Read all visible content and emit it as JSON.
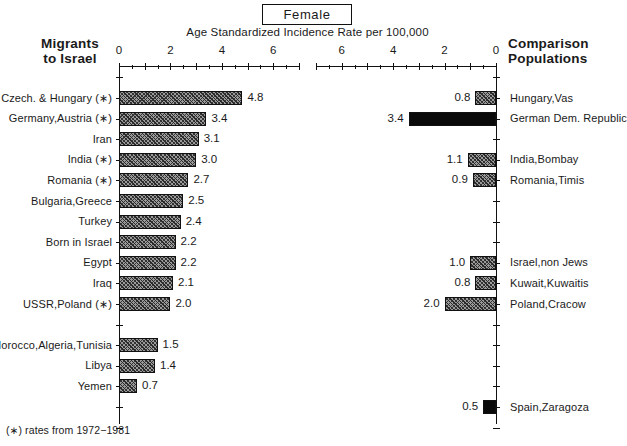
{
  "header": {
    "title": "Female",
    "subtitle": "Age Standardized Incidence Rate per 100,000"
  },
  "left_panel": {
    "heading_line1": "Migrants",
    "heading_line2": "to Israel"
  },
  "right_panel": {
    "heading_line1": "Comparison",
    "heading_line2": "Populations"
  },
  "footnote": "(∗) rates from 1972−1981",
  "axis": {
    "tick_labels": [
      "0",
      "2",
      "4",
      "6"
    ],
    "minor_step": 1,
    "max": 7,
    "left_ticks": [
      "0",
      "2",
      "4",
      "6"
    ],
    "right_ticks": [
      "6",
      "4",
      "2",
      "0"
    ]
  },
  "chart_data": {
    "type": "bar",
    "title": "Female",
    "subtitle": "Age Standardized Incidence Rate per 100,000",
    "xlabel": "Age Standardized Incidence Rate per 100,000",
    "ylabel": "",
    "xlim": [
      0,
      7
    ],
    "grid": false,
    "orientation": "horizontal",
    "legend": "none",
    "footnote": "(∗) rates from 1972−1981",
    "panels": [
      {
        "name": "Migrants to Israel",
        "direction": "left-to-right",
        "categories": [
          "Czech. & Hungary (∗)",
          "Germany,Austria (∗)",
          "Iran",
          "India (∗)",
          "Romania (∗)",
          "Bulgaria,Greece",
          "Turkey",
          "Born in Israel",
          "Egypt",
          "Iraq",
          "USSR,Poland (∗)",
          "Morocco,Algeria,Tunisia",
          "Libya",
          "Yemen"
        ],
        "values": [
          4.8,
          3.4,
          3.1,
          3.0,
          2.7,
          2.5,
          2.4,
          2.2,
          2.2,
          2.1,
          2.0,
          1.5,
          1.4,
          0.7
        ],
        "fills": [
          "hatch",
          "hatch",
          "hatch",
          "hatch",
          "hatch",
          "hatch",
          "hatch",
          "hatch",
          "hatch",
          "hatch",
          "hatch",
          "hatch",
          "hatch",
          "hatch"
        ]
      },
      {
        "name": "Comparison Populations",
        "direction": "right-to-left",
        "categories": [
          "Hungary,Vas",
          "German Dem. Republic",
          "India,Bombay",
          "Romania,Timis",
          "Israel,non Jews",
          "Kuwait,Kuwaitis",
          "Poland,Cracow",
          "Spain,Zaragoza"
        ],
        "values": [
          0.8,
          3.4,
          1.1,
          0.9,
          1.0,
          0.8,
          2.0,
          0.5
        ],
        "fills": [
          "hatch",
          "solid",
          "hatch",
          "hatch",
          "hatch",
          "hatch",
          "hatch",
          "solid"
        ]
      }
    ]
  },
  "rows": {
    "left": [
      {
        "label": "Czech. & Hungary (∗)",
        "value": 4.8,
        "value_text": "4.8",
        "fill": "hatch",
        "slot": 0
      },
      {
        "label": "Germany,Austria (∗)",
        "value": 3.4,
        "value_text": "3.4",
        "fill": "hatch",
        "slot": 1
      },
      {
        "label": "Iran",
        "value": 3.1,
        "value_text": "3.1",
        "fill": "hatch",
        "slot": 2
      },
      {
        "label": "India (∗)",
        "value": 3.0,
        "value_text": "3.0",
        "fill": "hatch",
        "slot": 3
      },
      {
        "label": "Romania (∗)",
        "value": 2.7,
        "value_text": "2.7",
        "fill": "hatch",
        "slot": 4
      },
      {
        "label": "Bulgaria,Greece",
        "value": 2.5,
        "value_text": "2.5",
        "fill": "hatch",
        "slot": 5
      },
      {
        "label": "Turkey",
        "value": 2.4,
        "value_text": "2.4",
        "fill": "hatch",
        "slot": 6
      },
      {
        "label": "Born in Israel",
        "value": 2.2,
        "value_text": "2.2",
        "fill": "hatch",
        "slot": 7
      },
      {
        "label": "Egypt",
        "value": 2.2,
        "value_text": "2.2",
        "fill": "hatch",
        "slot": 8
      },
      {
        "label": "Iraq",
        "value": 2.1,
        "value_text": "2.1",
        "fill": "hatch",
        "slot": 9
      },
      {
        "label": "USSR,Poland (∗)",
        "value": 2.0,
        "value_text": "2.0",
        "fill": "hatch",
        "slot": 10
      },
      {
        "label": "Morocco,Algeria,Tunisia",
        "value": 1.5,
        "value_text": "1.5",
        "fill": "hatch",
        "slot": 12
      },
      {
        "label": "Libya",
        "value": 1.4,
        "value_text": "1.4",
        "fill": "hatch",
        "slot": 13
      },
      {
        "label": "Yemen",
        "value": 0.7,
        "value_text": "0.7",
        "fill": "hatch",
        "slot": 14
      }
    ],
    "right": [
      {
        "label": "Hungary,Vas",
        "value": 0.8,
        "value_text": "0.8",
        "fill": "hatch",
        "slot": 0
      },
      {
        "label": "German Dem. Republic",
        "value": 3.4,
        "value_text": "3.4",
        "fill": "solid",
        "slot": 1
      },
      {
        "label": "India,Bombay",
        "value": 1.1,
        "value_text": "1.1",
        "fill": "hatch",
        "slot": 3
      },
      {
        "label": "Romania,Timis",
        "value": 0.9,
        "value_text": "0.9",
        "fill": "hatch",
        "slot": 4
      },
      {
        "label": "Israel,non Jews",
        "value": 1.0,
        "value_text": "1.0",
        "fill": "hatch",
        "slot": 8
      },
      {
        "label": "Kuwait,Kuwaitis",
        "value": 0.8,
        "value_text": "0.8",
        "fill": "hatch",
        "slot": 9
      },
      {
        "label": "Poland,Cracow",
        "value": 2.0,
        "value_text": "2.0",
        "fill": "hatch",
        "slot": 10
      },
      {
        "label": "Spain,Zaragoza",
        "value": 0.5,
        "value_text": "0.5",
        "fill": "solid",
        "slot": 15
      }
    ]
  },
  "colors": {
    "ink": "#111111",
    "bar_solid": "#0a0a0a",
    "bar_hatch_base": "#9a9a9a",
    "background": "#ffffff"
  }
}
